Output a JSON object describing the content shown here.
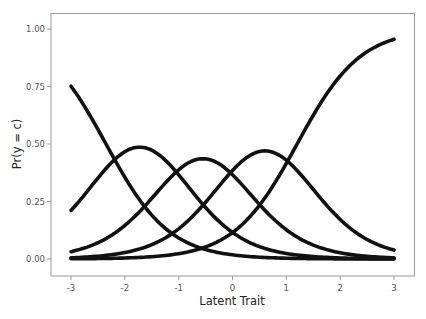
{
  "chart_data": {
    "type": "line",
    "title": "",
    "xlabel": "Latent Trait",
    "ylabel": "Pr(y = c)",
    "xlim": [
      -3,
      3
    ],
    "ylim": [
      0,
      1
    ],
    "x_ticks": [
      "-3",
      "-2",
      "-1",
      "0",
      "1",
      "2",
      "3"
    ],
    "y_ticks": [
      "0.00",
      "0.25",
      "0.50",
      "0.75",
      "1.00"
    ],
    "grid": false,
    "legend": null,
    "line_color": "#111111",
    "model": {
      "kind": "graded response category probabilities",
      "discrimination": 1.7,
      "thresholds": [
        -2.35,
        -1.1,
        0.0,
        1.2
      ]
    },
    "x": [
      -3,
      -2.5,
      -2,
      -1.5,
      -1,
      -0.5,
      0,
      0.5,
      1,
      1.5,
      2,
      2.5,
      3
    ],
    "series": [
      {
        "name": "c = 1",
        "values": [
          0.75,
          0.56,
          0.36,
          0.19,
          0.09,
          0.04,
          0.02,
          0.01,
          0.0,
          0.0,
          0.0,
          0.0,
          0.0
        ]
      },
      {
        "name": "c = 2",
        "values": [
          0.21,
          0.35,
          0.43,
          0.43,
          0.32,
          0.19,
          0.11,
          0.05,
          0.02,
          0.01,
          0.0,
          0.0,
          0.0
        ]
      },
      {
        "name": "c = 3",
        "values": [
          0.03,
          0.08,
          0.17,
          0.3,
          0.39,
          0.39,
          0.37,
          0.25,
          0.14,
          0.07,
          0.03,
          0.01,
          0.01
        ]
      },
      {
        "name": "c = 4",
        "values": [
          0.0,
          0.01,
          0.03,
          0.07,
          0.15,
          0.28,
          0.38,
          0.41,
          0.33,
          0.2,
          0.1,
          0.05,
          0.03
        ]
      },
      {
        "name": "c = 5",
        "values": [
          0.0,
          0.0,
          0.01,
          0.01,
          0.03,
          0.07,
          0.12,
          0.27,
          0.51,
          0.72,
          0.87,
          0.94,
          0.96
        ]
      }
    ]
  }
}
